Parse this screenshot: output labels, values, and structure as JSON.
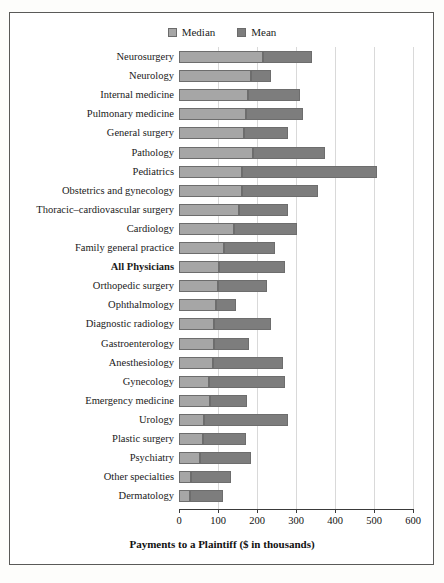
{
  "legend": {
    "entries": [
      {
        "label": "Median",
        "color": "#a6a6a6"
      },
      {
        "label": "Mean",
        "color": "#7d7d7d"
      }
    ]
  },
  "axis": {
    "title": "Payments to a Plaintiff ($ in thousands)",
    "ticks": [
      "0",
      "100",
      "200",
      "300",
      "400",
      "500",
      "600"
    ]
  },
  "chart_data": {
    "type": "bar",
    "orientation": "horizontal",
    "title": "",
    "subtitle": "",
    "xlabel": "Payments to a Plaintiff ($ in thousands)",
    "ylabel": "",
    "xlim": [
      0,
      600
    ],
    "xticks": [
      0,
      100,
      200,
      300,
      400,
      500,
      600
    ],
    "grid": true,
    "legend_position": "top-center",
    "categories": [
      "Neurosurgery",
      "Neurology",
      "Internal medicine",
      "Pulmonary medicine",
      "General surgery",
      "Pathology",
      "Pediatrics",
      "Obstetrics and gynecology",
      "Thoracic–cardiovascular surgery",
      "Cardiology",
      "Family general practice",
      "All Physicians",
      "Orthopedic surgery",
      "Ophthalmology",
      "Diagnostic radiology",
      "Gastroenterology",
      "Anesthesiology",
      "Gynecology",
      "Emergency medicine",
      "Urology",
      "Plastic surgery",
      "Psychiatry",
      "Other specialties",
      "Dermatology"
    ],
    "emphasized_categories": [
      "All Physicians"
    ],
    "series": [
      {
        "name": "Median",
        "color": "#a6a6a6",
        "values": [
          215,
          185,
          177,
          172,
          167,
          190,
          162,
          162,
          154,
          141,
          115,
          103,
          100,
          95,
          90,
          90,
          87,
          77,
          79,
          64,
          62,
          54,
          31,
          28
        ]
      },
      {
        "name": "Mean",
        "color": "#7d7d7d",
        "values": [
          341,
          236,
          310,
          318,
          279,
          374,
          508,
          356,
          279,
          302,
          246,
          272,
          226,
          146,
          236,
          179,
          267,
          272,
          174,
          279,
          172,
          185,
          133,
          113
        ]
      }
    ],
    "note": "Each row draws the Median bar from 0 to the median value, then the Mean bar continuing from the median value to the mean value."
  }
}
